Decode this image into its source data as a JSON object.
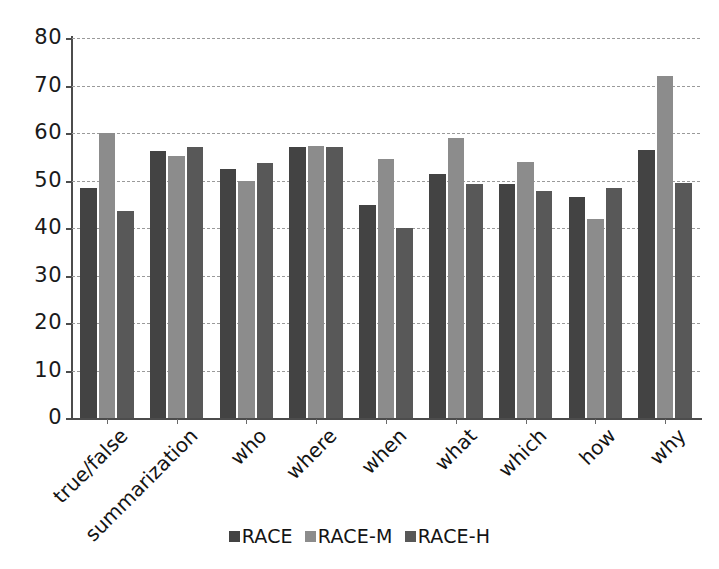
{
  "chart_data": {
    "type": "bar",
    "title": "",
    "subtitle": "",
    "xlabel": "",
    "ylabel": "",
    "ylim": [
      0,
      80
    ],
    "ytick_step": 10,
    "yticks": [
      0,
      10,
      20,
      30,
      40,
      50,
      60,
      70,
      80
    ],
    "ytick_labels": [
      "0",
      "10",
      "20",
      "30",
      "40",
      "50",
      "60",
      "70",
      "80"
    ],
    "grid": true,
    "grid_style": "dashed-horizontal",
    "legend_position": "bottom-center",
    "categories": [
      "true/false",
      "summarization",
      "who",
      "where",
      "when",
      "what",
      "which",
      "how",
      "why"
    ],
    "series": [
      {
        "name": "RACE",
        "color": "#434343",
        "values": [
          48.5,
          56.3,
          52.5,
          57.0,
          44.8,
          51.3,
          49.2,
          46.5,
          56.5
        ]
      },
      {
        "name": "RACE-M",
        "color": "#8c8c8c",
        "values": [
          60.0,
          55.2,
          50.0,
          57.3,
          54.5,
          59.0,
          53.8,
          41.8,
          72.0
        ]
      },
      {
        "name": "RACE-H",
        "color": "#585858",
        "values": [
          43.5,
          57.0,
          53.7,
          57.0,
          40.0,
          49.2,
          47.8,
          48.5,
          49.5
        ]
      }
    ]
  },
  "legend": {
    "items": [
      {
        "label": "RACE",
        "color": "#434343"
      },
      {
        "label": "RACE-M",
        "color": "#8c8c8c"
      },
      {
        "label": "RACE-H",
        "color": "#585858"
      }
    ]
  },
  "axes": {
    "y_max_label": "80",
    "y_min_label": "0"
  }
}
